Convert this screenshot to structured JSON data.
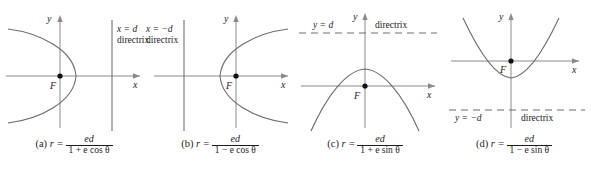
{
  "figure": {
    "background_color": "#ffffff",
    "curve_color": "#6b6b6b",
    "axis_color": "#8a8a8a",
    "text_color": "#1d1d1d",
    "directrix_color": "#6f6f6f"
  },
  "panels": [
    {
      "id": "a",
      "tag": "(a)",
      "equation_lead": "r =",
      "numerator": "ed",
      "denominator": "1 + e cos θ",
      "axis_x_label": "x",
      "axis_y_label": "y",
      "focus_label": "F",
      "directrix_equation": "x = d",
      "directrix_word": "directrix",
      "directrix_orientation": "vertical",
      "directrix_style": "solid",
      "conic_opening": "left"
    },
    {
      "id": "b",
      "tag": "(b)",
      "equation_lead": "r =",
      "numerator": "ed",
      "denominator": "1 − e cos θ",
      "axis_x_label": "x",
      "axis_y_label": "y",
      "focus_label": "F",
      "directrix_equation": "x = −d",
      "directrix_word": "directrix",
      "directrix_orientation": "vertical",
      "directrix_style": "solid",
      "conic_opening": "right"
    },
    {
      "id": "c",
      "tag": "(c)",
      "equation_lead": "r =",
      "numerator": "ed",
      "denominator": "1 + e sin θ",
      "axis_x_label": "x",
      "axis_y_label": "y",
      "focus_label": "F",
      "directrix_equation": "y = d",
      "directrix_word": "directrix",
      "directrix_orientation": "horizontal",
      "directrix_style": "dashed",
      "conic_opening": "down"
    },
    {
      "id": "d",
      "tag": "(d)",
      "equation_lead": "r =",
      "numerator": "ed",
      "denominator": "1 − e sin θ",
      "axis_x_label": "x",
      "axis_y_label": "y",
      "focus_label": "F",
      "directrix_equation": "y = −d",
      "directrix_word": "directrix",
      "directrix_orientation": "horizontal",
      "directrix_style": "dashed",
      "conic_opening": "up"
    }
  ]
}
